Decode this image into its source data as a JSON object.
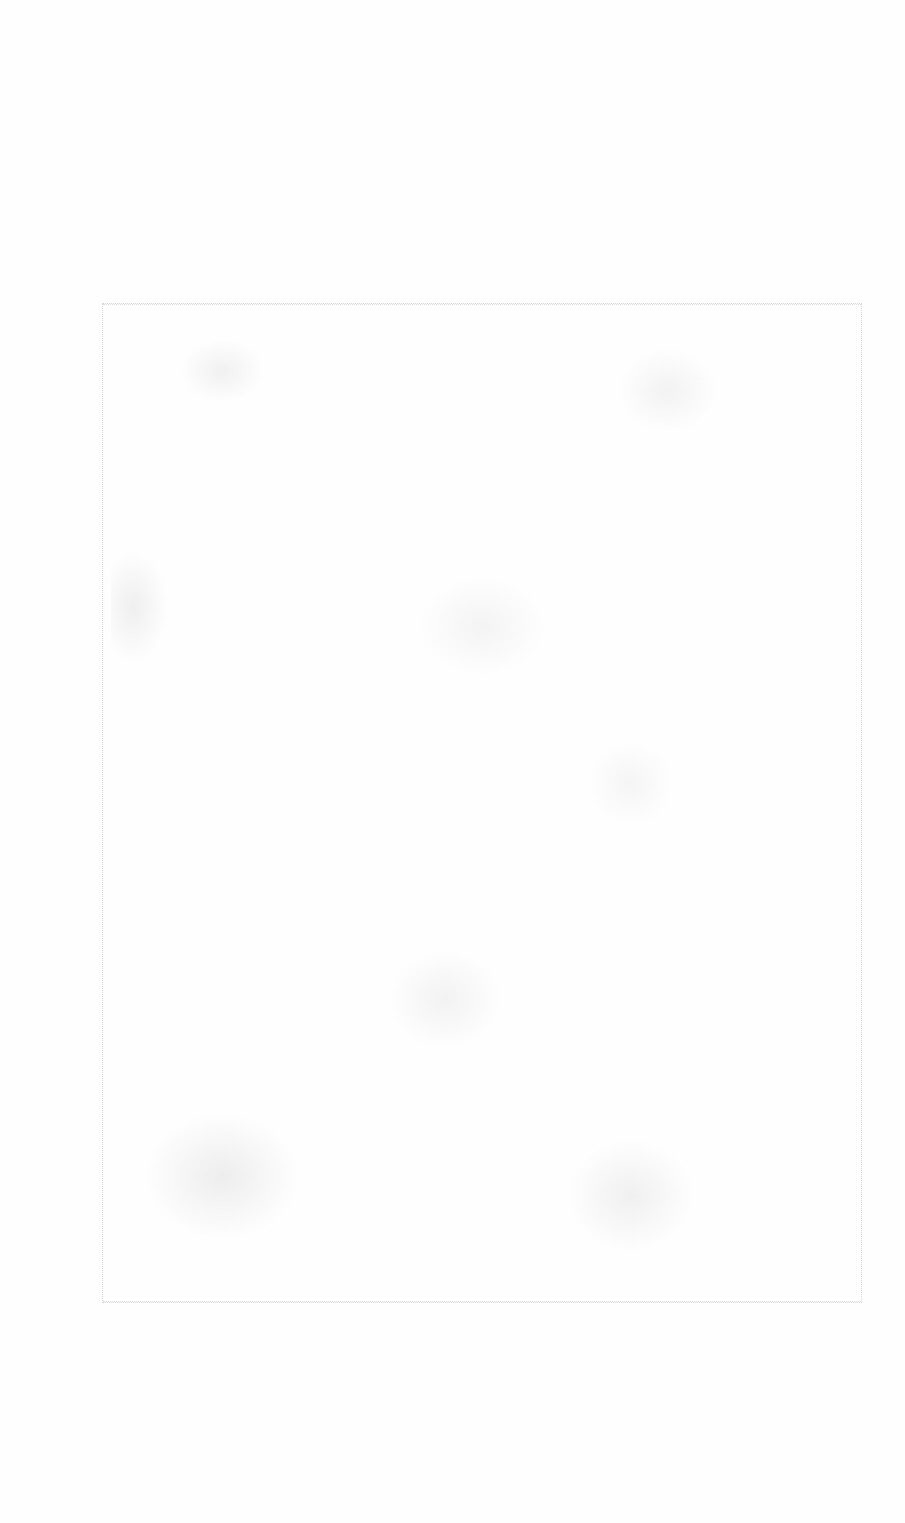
{
  "page": {
    "background_color": "#fefefe",
    "frame_color": "#d6d6d6",
    "texture_color": "#b4b4b4"
  }
}
